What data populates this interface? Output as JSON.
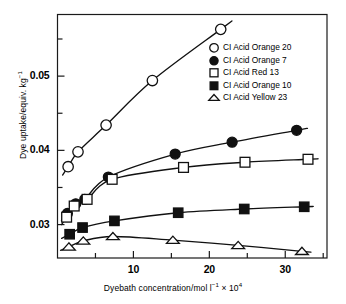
{
  "chart_data": {
    "type": "line",
    "title": "",
    "xlabel": "Dyebath concentration/mol l⁻¹ × 10⁴",
    "ylabel": "Dye uptake/equiv. kg⁻¹",
    "xlim": [
      0,
      35.5
    ],
    "ylim": [
      0.0255,
      0.0583
    ],
    "xticks": [
      10,
      20,
      30
    ],
    "xtick_labels": [
      "10",
      "20",
      "30"
    ],
    "xminorticks": [
      5,
      15,
      25,
      35
    ],
    "yticks": [
      0.03,
      0.04,
      0.05
    ],
    "ytick_labels": [
      "0.03",
      "0.04",
      "0.05"
    ],
    "yminorticks": [
      0.035,
      0.045,
      0.055
    ],
    "grid": false,
    "legend_position": "upper right",
    "series": [
      {
        "name": "CI Acid Orange 20",
        "marker": "open-circle",
        "color": "#000000",
        "x": [
          1.4,
          2.7,
          6.4,
          12.5,
          21.5
        ],
        "y": [
          0.0378,
          0.0398,
          0.0434,
          0.0494,
          0.0563
        ]
      },
      {
        "name": "CI Acid Orange 7",
        "marker": "filled-circle",
        "color": "#000000",
        "x": [
          1.3,
          2.4,
          3.6,
          6.7,
          15.5,
          23.0,
          31.5
        ],
        "y": [
          0.0315,
          0.0328,
          0.0334,
          0.0364,
          0.0395,
          0.0411,
          0.0427
        ]
      },
      {
        "name": "CI Acid Red 13",
        "marker": "open-square",
        "color": "#000000",
        "x": [
          1.2,
          2.2,
          3.9,
          7.2,
          16.6,
          24.7,
          33.0
        ],
        "y": [
          0.031,
          0.0325,
          0.0334,
          0.0361,
          0.0377,
          0.0384,
          0.0388
        ]
      },
      {
        "name": "CI Acid Orange 10",
        "marker": "filled-square",
        "color": "#000000",
        "x": [
          1.6,
          3.3,
          7.5,
          15.9,
          24.6,
          32.5
        ],
        "y": [
          0.0287,
          0.0296,
          0.0305,
          0.0316,
          0.0321,
          0.0324
        ]
      },
      {
        "name": "CI Acid Yellow 23",
        "marker": "open-triangle",
        "color": "#000000",
        "x": [
          1.5,
          3.4,
          7.3,
          15.2,
          23.8,
          32.2
        ],
        "y": [
          0.027,
          0.0278,
          0.0284,
          0.0279,
          0.0272,
          0.0264
        ]
      }
    ]
  },
  "axis": {
    "ylabel": "Dye uptake/equiv. kg",
    "ylabel_sup": "−1",
    "xlabel_a": "Dyebath concentration/mol l",
    "xlabel_sup1": "−1",
    "xlabel_b": " × 10",
    "xlabel_sup2": "4"
  },
  "legend": {
    "items": [
      {
        "label": "CI Acid Orange 20",
        "marker": "open-circle"
      },
      {
        "label": "CI Acid Orange 7",
        "marker": "filled-circle"
      },
      {
        "label": "CI Acid Red 13",
        "marker": "open-square"
      },
      {
        "label": "CI Acid Orange 10",
        "marker": "filled-square"
      },
      {
        "label": "CI Acid Yellow 23",
        "marker": "open-triangle"
      }
    ]
  }
}
